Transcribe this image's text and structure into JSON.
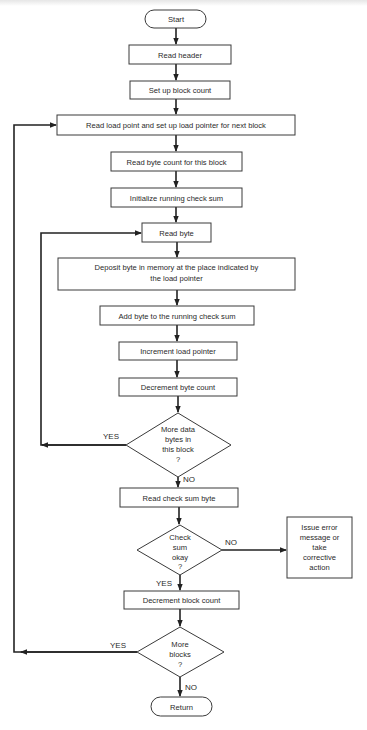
{
  "diagram": {
    "type": "flowchart",
    "colors": {
      "stroke": "#3a3a3a",
      "edge": "#222222",
      "text": "#2a2a2a",
      "background": "#ffffff"
    },
    "nodes": {
      "start": {
        "shape": "terminal",
        "label": "Start"
      },
      "read_header": {
        "shape": "process",
        "label": "Read header"
      },
      "setup_block_count": {
        "shape": "process",
        "label": "Set up block count"
      },
      "read_load_point": {
        "shape": "process",
        "label": "Read load point and set up load pointer for next block"
      },
      "read_byte_count": {
        "shape": "process",
        "label": "Read byte count for this block"
      },
      "init_checksum": {
        "shape": "process",
        "label": "Initialize running check sum"
      },
      "read_byte": {
        "shape": "process",
        "label": "Read byte"
      },
      "deposit_byte": {
        "shape": "process",
        "label_lines": [
          "Deposit byte in memory at the place indicated by",
          "the load pointer"
        ]
      },
      "add_byte": {
        "shape": "process",
        "label": "Add byte to the running check sum"
      },
      "inc_load_pointer": {
        "shape": "process",
        "label": "Increment load pointer"
      },
      "dec_byte_count": {
        "shape": "process",
        "label": "Decrement byte count"
      },
      "more_data_bytes": {
        "shape": "decision",
        "label_lines": [
          "More data",
          "bytes in",
          "this block",
          "?"
        ]
      },
      "read_checksum_byte": {
        "shape": "process",
        "label": "Read check sum byte"
      },
      "checksum_okay": {
        "shape": "decision",
        "label_lines": [
          "Check",
          "sum",
          "okay",
          "?"
        ]
      },
      "issue_error": {
        "shape": "process",
        "label_lines": [
          "Issue error",
          "message or",
          "take",
          "corrective",
          "action"
        ]
      },
      "dec_block_count": {
        "shape": "process",
        "label": "Decrement block count"
      },
      "more_blocks": {
        "shape": "decision",
        "label_lines": [
          "More",
          "blocks",
          "?"
        ]
      },
      "return": {
        "shape": "terminal",
        "label": "Return"
      }
    },
    "edges": [
      {
        "from": "start",
        "to": "read_header"
      },
      {
        "from": "read_header",
        "to": "setup_block_count"
      },
      {
        "from": "setup_block_count",
        "to": "read_load_point"
      },
      {
        "from": "read_load_point",
        "to": "read_byte_count"
      },
      {
        "from": "read_byte_count",
        "to": "init_checksum"
      },
      {
        "from": "init_checksum",
        "to": "read_byte"
      },
      {
        "from": "read_byte",
        "to": "deposit_byte"
      },
      {
        "from": "deposit_byte",
        "to": "add_byte"
      },
      {
        "from": "add_byte",
        "to": "inc_load_pointer"
      },
      {
        "from": "inc_load_pointer",
        "to": "dec_byte_count"
      },
      {
        "from": "dec_byte_count",
        "to": "more_data_bytes"
      },
      {
        "from": "more_data_bytes",
        "to": "read_byte",
        "label": "YES"
      },
      {
        "from": "more_data_bytes",
        "to": "read_checksum_byte",
        "label": "NO"
      },
      {
        "from": "read_checksum_byte",
        "to": "checksum_okay"
      },
      {
        "from": "checksum_okay",
        "to": "issue_error",
        "label": "NO"
      },
      {
        "from": "checksum_okay",
        "to": "dec_block_count",
        "label": "YES"
      },
      {
        "from": "dec_block_count",
        "to": "more_blocks"
      },
      {
        "from": "more_blocks",
        "to": "read_load_point",
        "label": "YES"
      },
      {
        "from": "more_blocks",
        "to": "return",
        "label": "NO"
      }
    ],
    "edge_labels": {
      "yes": "YES",
      "no": "NO"
    }
  }
}
